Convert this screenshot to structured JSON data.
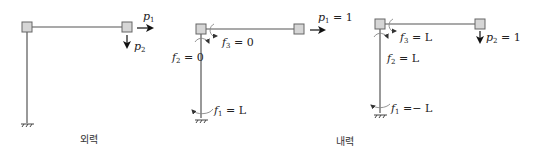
{
  "panels": {
    "external": {
      "caption": "외력",
      "loads": [
        {
          "symbol": "p",
          "sub": "1",
          "direction": "right"
        },
        {
          "symbol": "p",
          "sub": "2",
          "direction": "down"
        }
      ]
    },
    "internal_1": {
      "load": {
        "symbol": "p",
        "sub": "1",
        "eq": " = 1"
      },
      "forces": [
        {
          "symbol": "f",
          "sub": "1",
          "eq": " = L"
        },
        {
          "symbol": "f",
          "sub": "2",
          "eq": " = 0"
        },
        {
          "symbol": "f",
          "sub": "3",
          "eq": " = 0"
        }
      ]
    },
    "internal_2": {
      "caption": "내력",
      "load": {
        "symbol": "p",
        "sub": "2",
        "eq": " = 1"
      },
      "forces": [
        {
          "symbol": "f",
          "sub": "1",
          "eq": " =− L"
        },
        {
          "symbol": "f",
          "sub": "2",
          "eq": " = L"
        },
        {
          "symbol": "f",
          "sub": "3",
          "eq": " = L"
        }
      ]
    }
  }
}
